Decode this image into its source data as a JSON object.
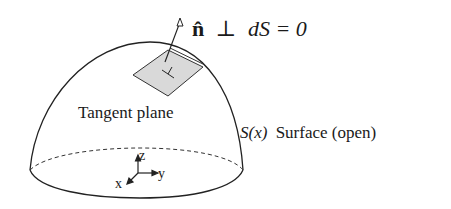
{
  "figure": {
    "equation": {
      "normal_symbol": "n̂",
      "perp_symbol": "⊥",
      "rhs": "dS = 0",
      "full": "n̂ ⊥ dS = 0"
    },
    "labels": {
      "tangent_plane": "Tangent plane",
      "surface_symbol": "S(x)",
      "surface_caption": "Surface (open)"
    },
    "axes": {
      "z": "z",
      "y": "y",
      "x": "x"
    },
    "colors": {
      "stroke": "#222222",
      "plane_fill": "#d9d9d9",
      "background": "#ffffff"
    }
  }
}
